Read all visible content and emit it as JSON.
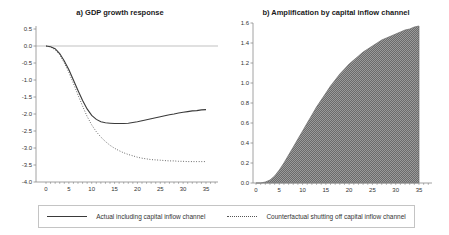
{
  "legend": {
    "items": [
      {
        "label": "Actual including capital inflow channel",
        "style": "solid"
      },
      {
        "label": "Counterfactual shutting off capital inflow channel",
        "style": "dotted"
      }
    ]
  },
  "colors": {
    "line": "#3a3a3a",
    "dotted_line": "#4a4a4a",
    "zero_line": "#a8a8a8",
    "axis": "#8a8a8a",
    "tick_label": "#333333",
    "area_dark": "#6b6b6b",
    "area_light": "#9a9a9a"
  },
  "chart_data": [
    {
      "type": "line",
      "title": "a) GDP growth response",
      "x": [
        0,
        1,
        2,
        3,
        4,
        5,
        6,
        7,
        8,
        9,
        10,
        11,
        12,
        13,
        14,
        15,
        16,
        17,
        18,
        19,
        20,
        21,
        22,
        23,
        24,
        25,
        26,
        27,
        28,
        29,
        30,
        31,
        32,
        33,
        34,
        35
      ],
      "series": [
        {
          "name": "Actual including capital inflow channel",
          "style": "solid",
          "color": "#3a3a3a",
          "values": [
            0.0,
            -0.02,
            -0.08,
            -0.22,
            -0.44,
            -0.7,
            -1.0,
            -1.31,
            -1.6,
            -1.85,
            -2.04,
            -2.16,
            -2.23,
            -2.26,
            -2.27,
            -2.28,
            -2.28,
            -2.28,
            -2.27,
            -2.25,
            -2.23,
            -2.2,
            -2.17,
            -2.14,
            -2.11,
            -2.08,
            -2.05,
            -2.02,
            -2.0,
            -1.97,
            -1.95,
            -1.93,
            -1.91,
            -1.9,
            -1.88,
            -1.87
          ]
        },
        {
          "name": "Counterfactual shutting off capital inflow channel",
          "style": "dotted",
          "color": "#4a4a4a",
          "values": [
            0.0,
            -0.03,
            -0.11,
            -0.26,
            -0.5,
            -0.78,
            -1.1,
            -1.44,
            -1.77,
            -2.07,
            -2.32,
            -2.52,
            -2.68,
            -2.81,
            -2.92,
            -3.01,
            -3.08,
            -3.14,
            -3.19,
            -3.23,
            -3.27,
            -3.3,
            -3.32,
            -3.34,
            -3.35,
            -3.36,
            -3.37,
            -3.38,
            -3.38,
            -3.39,
            -3.39,
            -3.4,
            -3.4,
            -3.4,
            -3.4,
            -3.4
          ]
        }
      ],
      "xlabel": "",
      "ylabel": "",
      "xlim": [
        0,
        35
      ],
      "ylim": [
        -4.0,
        0.5
      ],
      "y_step": 0.5,
      "x_label_step": 5,
      "x_minor_step": 1,
      "zero_line": true,
      "grid": false,
      "legend_position": "bottom"
    },
    {
      "type": "area",
      "title": "b) Amplification by capital inflow channel",
      "x": [
        0,
        1,
        2,
        3,
        4,
        5,
        6,
        7,
        8,
        9,
        10,
        11,
        12,
        13,
        14,
        15,
        16,
        17,
        18,
        19,
        20,
        21,
        22,
        23,
        24,
        25,
        26,
        27,
        28,
        29,
        30,
        31,
        32,
        33,
        34,
        35
      ],
      "values": [
        0.0,
        0.0,
        0.01,
        0.03,
        0.07,
        0.13,
        0.2,
        0.28,
        0.36,
        0.44,
        0.52,
        0.6,
        0.68,
        0.76,
        0.83,
        0.9,
        0.97,
        1.03,
        1.09,
        1.14,
        1.19,
        1.23,
        1.27,
        1.31,
        1.34,
        1.37,
        1.4,
        1.43,
        1.45,
        1.47,
        1.49,
        1.51,
        1.53,
        1.54,
        1.56,
        1.57
      ],
      "xlabel": "",
      "ylabel": "",
      "xlim": [
        0,
        35
      ],
      "ylim": [
        0.0,
        1.6
      ],
      "y_step": 0.2,
      "x_label_step": 5,
      "x_minor_step": 1,
      "zero_line": false,
      "grid": false,
      "legend_position": "none"
    }
  ]
}
